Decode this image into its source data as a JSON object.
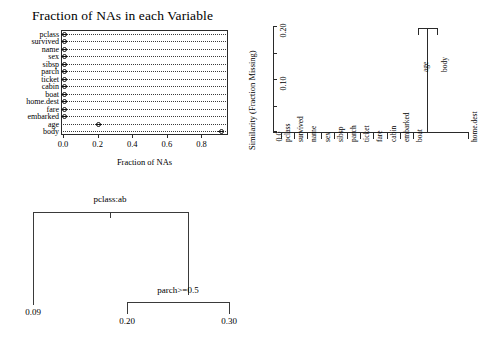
{
  "chart_data": [
    {
      "type": "bar",
      "subtype": "dotchart",
      "title": "Fraction of NAs in each Variable",
      "xlabel": "Fraction of NAs",
      "ylabel": "",
      "xlim": [
        0.0,
        0.93
      ],
      "xticks": [
        "0.0",
        "0.2",
        "0.4",
        "0.6",
        "0.8"
      ],
      "xtickvalues": [
        0.0,
        0.2,
        0.4,
        0.6,
        0.8
      ],
      "grid": "dotted-leader-lines",
      "categories": [
        "pclass",
        "survived",
        "name",
        "sex",
        "sibsp",
        "parch",
        "ticket",
        "cabin",
        "boat",
        "home.dest",
        "fare",
        "embarked",
        "age",
        "body"
      ],
      "values": [
        0.0,
        0.0,
        0.0,
        0.0,
        0.0,
        0.0,
        0.0,
        0.0,
        0.0,
        0.0,
        0.0,
        0.0,
        0.201,
        0.908
      ]
    },
    {
      "type": "line",
      "subtype": "dendrogram",
      "title": "",
      "xlabel": "",
      "ylabel": "Similarity (Fraction Missing)",
      "ylim": [
        0.0,
        0.21
      ],
      "yticks": [
        "0.0",
        "0.10",
        "0.20"
      ],
      "ytickvalues": [
        0.0,
        0.1,
        0.2
      ],
      "leaves": [
        "pclass",
        "survived",
        "name",
        "sex",
        "sibsp",
        "parch",
        "ticket",
        "fare",
        "cabin",
        "embarked",
        "boat",
        "age",
        "body",
        "home.dest"
      ],
      "merges": [
        {
          "members": [
            "age",
            "body"
          ],
          "height": 0.2
        },
        {
          "members": [
            "pclass",
            "survived",
            "name",
            "sex",
            "sibsp",
            "parch",
            "ticket",
            "fare",
            "cabin",
            "embarked",
            "boat",
            "age+body",
            "home.dest"
          ],
          "height": 0.0
        }
      ]
    },
    {
      "type": "table",
      "subtype": "decision-tree",
      "title": "",
      "nodes": [
        {
          "id": "root",
          "label": "pclass:ab",
          "kind": "split"
        },
        {
          "id": "leaf1",
          "label": "0.09",
          "kind": "leaf"
        },
        {
          "id": "n2",
          "label": "parch>=0.5",
          "kind": "split"
        },
        {
          "id": "leaf2",
          "label": "0.20",
          "kind": "leaf"
        },
        {
          "id": "leaf3",
          "label": "0.30",
          "kind": "leaf"
        }
      ]
    }
  ],
  "dotchart": {
    "title": "Fraction of NAs in each Variable",
    "xlabel": "Fraction of NAs",
    "xticks": [
      "0.0",
      "0.2",
      "0.4",
      "0.6",
      "0.8"
    ],
    "rows": [
      {
        "label": "pclass",
        "value": 0.0
      },
      {
        "label": "survived",
        "value": 0.0
      },
      {
        "label": "name",
        "value": 0.0
      },
      {
        "label": "sex",
        "value": 0.0
      },
      {
        "label": "sibsp",
        "value": 0.0
      },
      {
        "label": "parch",
        "value": 0.0
      },
      {
        "label": "ticket",
        "value": 0.0
      },
      {
        "label": "cabin",
        "value": 0.0
      },
      {
        "label": "boat",
        "value": 0.0
      },
      {
        "label": "home.dest",
        "value": 0.0
      },
      {
        "label": "fare",
        "value": 0.0
      },
      {
        "label": "embarked",
        "value": 0.0
      },
      {
        "label": "age",
        "value": 0.201
      },
      {
        "label": "body",
        "value": 0.908
      }
    ]
  },
  "dendrogram": {
    "ylabel": "Similarity (Fraction Missing)",
    "yticks": [
      "0.20",
      "0.10",
      "0.0"
    ],
    "leaves": [
      {
        "label": "pclass"
      },
      {
        "label": "survived"
      },
      {
        "label": "name"
      },
      {
        "label": "sex"
      },
      {
        "label": "sibsp"
      },
      {
        "label": "parch"
      },
      {
        "label": "ticket"
      },
      {
        "label": "fare"
      },
      {
        "label": "cabin"
      },
      {
        "label": "embarked"
      },
      {
        "label": "boat"
      },
      {
        "label": "home.dest"
      }
    ],
    "cluster": {
      "height_label": "0.20",
      "left_label": "age",
      "right_label": "body"
    }
  },
  "tree": {
    "root_split": "pclass:ab",
    "second_split": "parch>=0.5",
    "leaf_left": "0.09",
    "leaf_mid": "0.20",
    "leaf_right": "0.30"
  }
}
